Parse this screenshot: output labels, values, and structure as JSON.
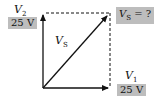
{
  "diagram": {
    "vectors": [
      {
        "name": "V1",
        "symbol": "V",
        "subscript": "1",
        "value": "25 V",
        "direction": "horizontal"
      },
      {
        "name": "V2",
        "symbol": "V",
        "subscript": "2",
        "value": "25 V",
        "direction": "vertical"
      },
      {
        "name": "VS",
        "symbol": "V",
        "subscript": "S",
        "direction": "diagonal-resultant"
      }
    ],
    "labels": {
      "v2_symbol": "V",
      "v2_sub": "2",
      "v2_value": "25 V",
      "v1_symbol": "V",
      "v1_sub": "1",
      "v1_value": "25 V",
      "vs_symbol": "V",
      "vs_sub": "S",
      "vs_question_symbol": "V",
      "vs_question_sub": "S",
      "vs_question_rest": " = ?"
    },
    "colors": {
      "line": "#111111",
      "label_box": "#bdbdbd",
      "background": "#ffffff"
    }
  }
}
